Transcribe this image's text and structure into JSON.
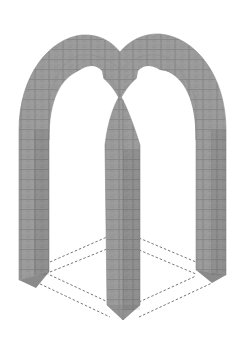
{
  "figure": {
    "style": "isometric line illustration with masonry texture",
    "colors": {
      "background": "#ffffff",
      "stone": "#9a9a9a",
      "stone_dark": "#7c7c7c",
      "joint": "#6a6a6a",
      "dashed_outline": "#777777"
    },
    "parts": {
      "piers": [
        {
          "id": "left-pier",
          "x": 19,
          "width": 30,
          "bottom": 280
        },
        {
          "id": "center-pier",
          "x": 107,
          "width": 32,
          "bottom": 320
        },
        {
          "id": "right-pier",
          "x": 196,
          "width": 30,
          "bottom": 280
        }
      ],
      "arches": [
        "left-arch",
        "right-arch",
        "cross-rib-left",
        "cross-rib-right"
      ],
      "ground_plan": "dashed square in isometric projection"
    }
  }
}
